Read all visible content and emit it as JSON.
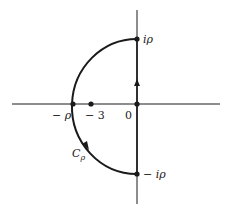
{
  "diagram": {
    "type": "contour-integration-path",
    "axes": {
      "real_axis": "horizontal",
      "imaginary_axis": "vertical"
    },
    "points": [
      {
        "id": "i-rho",
        "label": "iρ",
        "desc": "top of semicircle on imaginary axis"
      },
      {
        "id": "neg-i-rho",
        "label": "− iρ",
        "desc": "bottom of semicircle on imaginary axis"
      },
      {
        "id": "neg-rho",
        "label": "− ρ",
        "desc": "leftmost point of arc on real axis"
      },
      {
        "id": "neg-3",
        "label": "− 3",
        "desc": "point on real axis"
      },
      {
        "id": "origin",
        "label": "0",
        "desc": "origin"
      }
    ],
    "contour_label": {
      "main": "C",
      "sub": "ρ"
    },
    "arrows": [
      {
        "on": "imaginary-axis-segment",
        "direction": "up"
      },
      {
        "on": "arc",
        "direction": "counterclockwise-downward"
      }
    ],
    "colors": {
      "stroke": "#1a1a1a",
      "background": "#ffffff"
    }
  }
}
